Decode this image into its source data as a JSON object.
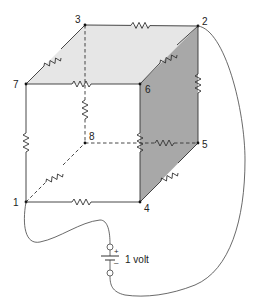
{
  "diagram": {
    "vertices": [
      {
        "id": "1",
        "label": "1",
        "x": 26,
        "y": 202
      },
      {
        "id": "2",
        "label": "2",
        "x": 198,
        "y": 26
      },
      {
        "id": "3",
        "label": "3",
        "x": 85,
        "y": 25
      },
      {
        "id": "4",
        "label": "4",
        "x": 140,
        "y": 202
      },
      {
        "id": "5",
        "label": "5",
        "x": 198,
        "y": 143
      },
      {
        "id": "6",
        "label": "6",
        "x": 140,
        "y": 84
      },
      {
        "id": "7",
        "label": "7",
        "x": 26,
        "y": 84
      },
      {
        "id": "8",
        "label": "8",
        "x": 85,
        "y": 143
      }
    ],
    "edges": [
      {
        "from": "3",
        "to": "2",
        "style": "solid",
        "resistor": true
      },
      {
        "from": "7",
        "to": "3",
        "style": "solid",
        "resistor": true
      },
      {
        "from": "7",
        "to": "6",
        "style": "solid",
        "resistor": true
      },
      {
        "from": "6",
        "to": "2",
        "style": "solid",
        "resistor": true
      },
      {
        "from": "2",
        "to": "5",
        "style": "solid",
        "resistor": true
      },
      {
        "from": "6",
        "to": "4",
        "style": "solid",
        "resistor": true
      },
      {
        "from": "7",
        "to": "1",
        "style": "solid",
        "resistor": true
      },
      {
        "from": "1",
        "to": "4",
        "style": "solid",
        "resistor": true
      },
      {
        "from": "4",
        "to": "5",
        "style": "solid",
        "resistor": true
      },
      {
        "from": "3",
        "to": "8",
        "style": "dashed",
        "resistor": true
      },
      {
        "from": "8",
        "to": "5",
        "style": "dashed",
        "resistor": true
      },
      {
        "from": "1",
        "to": "8",
        "style": "dashed",
        "resistor": true
      }
    ],
    "faces": [
      {
        "name": "top-face",
        "color": "#e6e6e6"
      },
      {
        "name": "right-face",
        "color": "#a8a8a8"
      }
    ],
    "battery": {
      "label": "1 volt",
      "plus": "+",
      "minus": "–"
    }
  }
}
